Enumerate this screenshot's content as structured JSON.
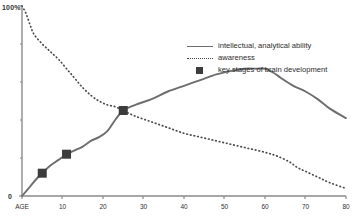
{
  "axes": {
    "y_max_label": "100%",
    "y_min_label": "0",
    "x_tick_labels": [
      "AGE",
      "10",
      "20",
      "30",
      "40",
      "50",
      "60",
      "70",
      "80"
    ]
  },
  "legend": {
    "items": [
      {
        "marker": "solid-line",
        "label": "intellectual, analytical ability"
      },
      {
        "marker": "dotted-line",
        "label": "awareness"
      },
      {
        "marker": "square",
        "label": "key stages of brain development"
      }
    ]
  },
  "colors": {
    "solid_line": "#6d6d6d",
    "dotted_line": "#4a4a4a",
    "marker": "#3c3c3c",
    "axis": "#8a8a8a",
    "text": "#2b2b2b",
    "background": "#ffffff"
  },
  "chart_data": {
    "type": "line",
    "title": "",
    "xlabel": "AGE",
    "ylabel": "",
    "xlim": [
      0,
      80
    ],
    "ylim": [
      0,
      100
    ],
    "grid": false,
    "legend_position": "upper-right",
    "x_ticks": [
      0,
      10,
      20,
      30,
      40,
      50,
      60,
      70,
      80
    ],
    "y_ticks": [
      0,
      100
    ],
    "series": [
      {
        "name": "intellectual, analytical ability",
        "style": "solid",
        "x": [
          0,
          2,
          4,
          5,
          7,
          9,
          11,
          13,
          15,
          17,
          19,
          21,
          23,
          25,
          28,
          32,
          36,
          40,
          44,
          48,
          52,
          55,
          58,
          60,
          62,
          64,
          67,
          70,
          73,
          76,
          80
        ],
        "y": [
          0,
          5,
          10,
          12,
          16,
          19,
          22,
          24,
          26,
          29,
          31,
          34,
          40,
          45,
          48,
          51,
          55,
          58,
          61,
          64,
          66,
          67,
          67,
          67,
          65,
          62,
          58,
          55,
          51,
          46,
          41
        ]
      },
      {
        "name": "awareness",
        "style": "dotted",
        "x": [
          0,
          1,
          2,
          3,
          5,
          7,
          9,
          11,
          13,
          15,
          17,
          19,
          21,
          23,
          25,
          28,
          32,
          36,
          40,
          44,
          48,
          52,
          56,
          60,
          63,
          66,
          68,
          70,
          73,
          76,
          80
        ],
        "y": [
          100,
          96,
          90,
          85,
          80,
          76,
          72,
          67,
          62,
          57,
          53,
          50,
          48,
          47,
          45,
          42,
          39,
          36,
          33,
          31,
          29,
          27,
          25,
          23,
          21,
          18,
          15,
          13,
          10,
          7,
          4
        ]
      }
    ],
    "markers": {
      "name": "key stages of brain development",
      "shape": "square",
      "points": [
        {
          "x": 5,
          "y": 12
        },
        {
          "x": 11,
          "y": 22
        },
        {
          "x": 25,
          "y": 45
        }
      ]
    }
  }
}
